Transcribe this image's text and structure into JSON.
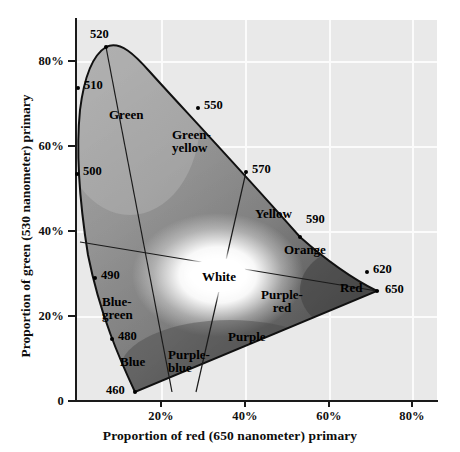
{
  "chart_data": {
    "type": "scatter",
    "title": "",
    "xlabel": "Proportion of red (650 nanometer) primary",
    "ylabel": "Proportion of green (530 nanometer) primary",
    "xlim": [
      -1,
      87
    ],
    "ylim": [
      0,
      91
    ],
    "xticks": [
      "20%",
      "40%",
      "60%",
      "80%"
    ],
    "xtick_values": [
      20,
      40,
      60,
      80
    ],
    "yticks": [
      "0",
      "20%",
      "40%",
      "60%",
      "80%"
    ],
    "ytick_values": [
      0,
      20,
      40,
      60,
      80
    ],
    "grid": true,
    "legend": "none",
    "spectral_locus_points": [
      {
        "label": "520",
        "x": 7.4,
        "y": 84.0
      },
      {
        "label": "510",
        "x": 0.6,
        "y": 74.2
      },
      {
        "label": "500",
        "x": 0.3,
        "y": 53.8
      },
      {
        "label": "490",
        "x": 4.8,
        "y": 29.0
      },
      {
        "label": "480",
        "x": 8.8,
        "y": 15.0
      },
      {
        "label": "460",
        "x": 14.0,
        "y": 2.2
      },
      {
        "label": "550",
        "x": 29.3,
        "y": 69.5
      },
      {
        "label": "570",
        "x": 40.7,
        "y": 54.5
      },
      {
        "label": "590",
        "x": 53.3,
        "y": 39.2
      },
      {
        "label": "620",
        "x": 69.5,
        "y": 30.7
      },
      {
        "label": "650",
        "x": 71.7,
        "y": 26.2
      }
    ],
    "white_point": {
      "label": "White",
      "x": 33.8,
      "y": 30.0
    },
    "region_labels": [
      "Green",
      "Green-yellow",
      "Yellow",
      "Orange",
      "Red",
      "Purple-red",
      "Purple",
      "Purple-blue",
      "Blue",
      "Blue-green",
      "White"
    ]
  },
  "axes": {
    "x_title": "Proportion of red (650 nanometer) primary",
    "y_title": "Proportion of green (530 nanometer) primary",
    "x_ticks": [
      {
        "label": "20%",
        "px": 161
      },
      {
        "label": "40%",
        "px": 245
      },
      {
        "label": "60%",
        "px": 329
      },
      {
        "label": "80%",
        "px": 412
      }
    ],
    "y_ticks": [
      {
        "label": "80%",
        "py": 61
      },
      {
        "label": "60%",
        "py": 146
      },
      {
        "label": "40%",
        "py": 231
      },
      {
        "label": "20%",
        "py": 316
      },
      {
        "label": "0",
        "py": 401
      }
    ]
  },
  "markers": [
    {
      "name": "wavelength-520",
      "text": "520",
      "dot_x": 106,
      "dot_y": 47,
      "tx": 90,
      "ty": 27
    },
    {
      "name": "wavelength-510",
      "text": "510",
      "dot_x": 78,
      "dot_y": 88,
      "tx": 84,
      "ty": 78
    },
    {
      "name": "wavelength-500",
      "text": "500",
      "dot_x": 77,
      "dot_y": 174,
      "tx": 83,
      "ty": 164
    },
    {
      "name": "wavelength-490",
      "text": "490",
      "dot_x": 95,
      "dot_y": 278,
      "tx": 101,
      "ty": 268
    },
    {
      "name": "wavelength-480",
      "text": "480",
      "dot_x": 112,
      "dot_y": 339,
      "tx": 118,
      "ty": 329
    },
    {
      "name": "wavelength-460",
      "text": "460",
      "dot_x": 135,
      "dot_y": 392,
      "tx": 106,
      "ty": 383
    },
    {
      "name": "wavelength-550",
      "text": "550",
      "dot_x": 198,
      "dot_y": 108,
      "tx": 204,
      "ty": 98
    },
    {
      "name": "wavelength-570",
      "text": "570",
      "dot_x": 246,
      "dot_y": 172,
      "tx": 252,
      "ty": 162
    },
    {
      "name": "wavelength-590",
      "text": "590",
      "dot_x": 300,
      "dot_y": 237,
      "tx": 306,
      "ty": 212
    },
    {
      "name": "wavelength-620",
      "text": "620",
      "dot_x": 367,
      "dot_y": 272,
      "tx": 373,
      "ty": 262
    },
    {
      "name": "wavelength-650",
      "text": "650",
      "dot_x": 377,
      "dot_y": 291,
      "tx": 385,
      "ty": 282
    }
  ],
  "regions": [
    {
      "name": "region-green",
      "text": "Green",
      "x": 109,
      "y": 108,
      "align": "left"
    },
    {
      "name": "region-green-yellow",
      "text": "Green-\nyellow",
      "x": 172,
      "y": 128,
      "align": "left"
    },
    {
      "name": "region-yellow",
      "text": "Yellow",
      "x": 255,
      "y": 207,
      "align": "left"
    },
    {
      "name": "region-orange",
      "text": "Orange",
      "x": 284,
      "y": 243,
      "align": "left"
    },
    {
      "name": "region-red",
      "text": "Red",
      "x": 340,
      "y": 281,
      "align": "left"
    },
    {
      "name": "region-purple-red",
      "text": "Purple-\nred",
      "x": 282,
      "y": 301,
      "align": "ctr"
    },
    {
      "name": "region-purple",
      "text": "Purple",
      "x": 228,
      "y": 330,
      "align": "left"
    },
    {
      "name": "region-purple-blue",
      "text": "Purple-\nblue",
      "x": 168,
      "y": 348,
      "align": "left"
    },
    {
      "name": "region-blue",
      "text": "Blue",
      "x": 120,
      "y": 355,
      "align": "left"
    },
    {
      "name": "region-blue-green",
      "text": "Blue-\ngreen",
      "x": 102,
      "y": 295,
      "align": "left"
    },
    {
      "name": "region-white",
      "text": "White",
      "x": 219,
      "y": 277,
      "align": "ctr"
    }
  ]
}
